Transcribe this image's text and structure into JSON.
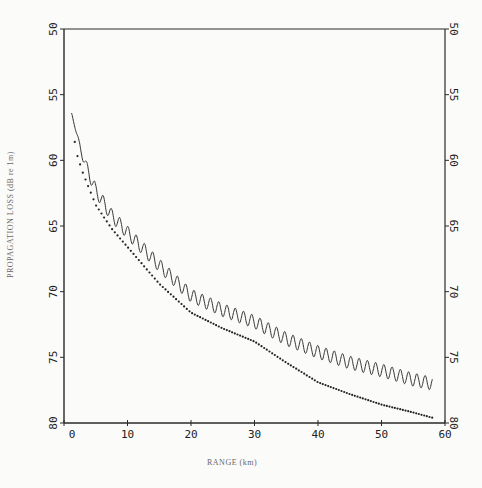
{
  "chart_data": {
    "type": "line",
    "title": "",
    "xlabel": "RANGE (km)",
    "ylabel": "PROPAGATION LOSS (dB re 1m)",
    "xlim": [
      0,
      60
    ],
    "ylim": [
      80,
      50
    ],
    "y_inverted": true,
    "x_ticks": [
      0,
      10,
      20,
      30,
      40,
      50,
      60
    ],
    "y_ticks": [
      50,
      55,
      60,
      65,
      70,
      75,
      80
    ],
    "y_tick_labels_both_sides": true,
    "grid": false,
    "legend": null,
    "series": [
      {
        "name": "solid (oscillating)",
        "style": "solid",
        "oscillation_amplitude_db": 0.5,
        "oscillation_period_km": 1.3,
        "x": [
          1.2,
          2,
          3,
          5,
          7.5,
          10,
          15,
          20,
          25,
          30,
          35,
          40,
          45,
          50,
          55,
          58
        ],
        "y": [
          56.4,
          58.0,
          59.8,
          62.3,
          64.2,
          65.5,
          68.0,
          70.3,
          71.4,
          72.3,
          73.6,
          74.6,
          75.4,
          76.0,
          76.7,
          77.0
        ]
      },
      {
        "name": "dotted",
        "style": "dots",
        "x": [
          1.7,
          2,
          3,
          5,
          7.5,
          10,
          15,
          20,
          25,
          30,
          35,
          40,
          45,
          50,
          55,
          58
        ],
        "y": [
          58.6,
          59.5,
          61.0,
          63.4,
          65.2,
          66.6,
          69.4,
          71.6,
          72.8,
          73.8,
          75.4,
          76.9,
          77.8,
          78.6,
          79.2,
          79.6
        ]
      }
    ]
  }
}
